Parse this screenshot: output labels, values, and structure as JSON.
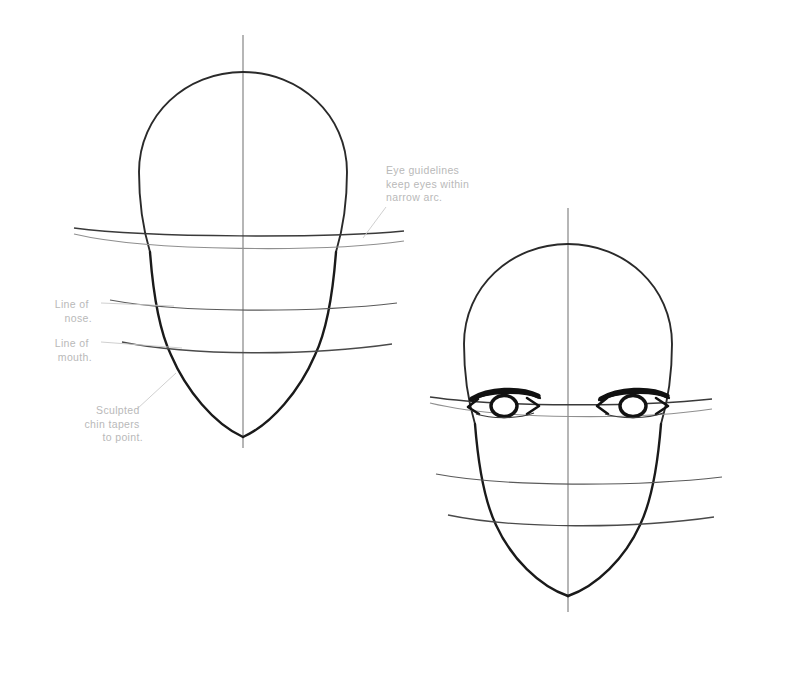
{
  "document": {
    "title": "Head Construction Guidelines",
    "background_color": "#ffffff",
    "medium": "pencil drawing",
    "figure_count": 2
  },
  "style": {
    "ink_color": "#1a1a1a",
    "guideline_color": "#4a4a4a",
    "light_guideline_color": "#8c8c8c",
    "annotation_text_color": "#b9b9b9",
    "leader_line_color": "#c9c9c9"
  },
  "annotations": [
    {
      "id": "eye-guidelines-note",
      "lines": [
        "Eye guidelines",
        "keep eyes within",
        "narrow arc."
      ],
      "full_text": "Eye guidelines keep eyes within narrow arc.",
      "align": "left",
      "x": 386,
      "y": 172,
      "leader": {
        "from_x": 386,
        "from_y": 207,
        "to_x": 363,
        "to_y": 238
      }
    },
    {
      "id": "line-of-nose-note",
      "lines": [
        "Line of",
        "nose."
      ],
      "full_text": "Line of nose.",
      "align": "right",
      "x": 92,
      "y": 306,
      "leader": {
        "from_x": 100,
        "from_y": 303,
        "to_x": 172,
        "to_y": 306
      }
    },
    {
      "id": "line-of-mouth-note",
      "lines": [
        "Line of",
        "mouth."
      ],
      "full_text": "Line of mouth.",
      "align": "right",
      "x": 92,
      "y": 345,
      "leader": {
        "from_x": 100,
        "from_y": 342,
        "to_x": 180,
        "to_y": 347
      }
    },
    {
      "id": "sculpted-chin-note",
      "lines": [
        "Sculpted",
        "chin tapers",
        "to point."
      ],
      "full_text": "Sculpted chin tapers to point.",
      "align": "right",
      "x": 143,
      "y": 412,
      "leader": {
        "from_x": 137,
        "from_y": 408,
        "to_x": 175,
        "to_y": 374
      }
    }
  ],
  "figures": [
    {
      "id": "head-left",
      "name": "head-construction-blank",
      "description": "Front-view head construction with centerline, eye guideline arcs, nose line, mouth line and tapered jaw. No eyes drawn.",
      "center_x": 243,
      "centerline": {
        "x": 243,
        "top_y": 35,
        "bottom_y": 448
      },
      "cranium": {
        "cx": 243,
        "cy": 170,
        "rx": 104,
        "ry": 98
      },
      "eye_guideline_upper_y": 232,
      "eye_guideline_lower_y": 245,
      "nose_line_y": 307,
      "mouth_line_y": 349,
      "chin_tip_y": 437,
      "has_eyes": false
    },
    {
      "id": "head-right",
      "name": "head-construction-with-eyes",
      "description": "Same construction with anime-style eyes placed inside the narrow eye guideline arcs.",
      "center_x": 568,
      "centerline": {
        "x": 568,
        "top_y": 208,
        "bottom_y": 612
      },
      "cranium": {
        "cx": 568,
        "cy": 342,
        "rx": 104,
        "ry": 98
      },
      "eye_guideline_upper_y": 400,
      "eye_guideline_lower_y": 413,
      "nose_line_y": 481,
      "mouth_line_y": 521,
      "chin_tip_y": 596,
      "has_eyes": true,
      "eyes": [
        {
          "side": "left",
          "cx": 505,
          "cy": 403,
          "width": 66,
          "height": 24
        },
        {
          "side": "right",
          "cx": 634,
          "cy": 403,
          "width": 66,
          "height": 24
        }
      ]
    }
  ]
}
